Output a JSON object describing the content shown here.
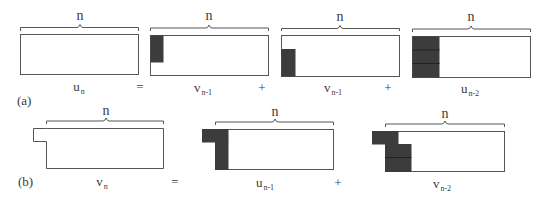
{
  "figure": {
    "row_a": {
      "tag": "(a)",
      "equation": {
        "lhs": {
          "base": "u",
          "sub": "n"
        },
        "eq": "=",
        "terms": [
          {
            "base": "v",
            "sub": "n-1"
          },
          {
            "op": "+"
          },
          {
            "base": "v",
            "sub": "n-1"
          },
          {
            "op": "+"
          },
          {
            "base": "u",
            "sub": "n-2"
          }
        ]
      },
      "brace_label": "n"
    },
    "row_b": {
      "tag": "(b)",
      "equation": {
        "lhs": {
          "base": "v",
          "sub": "n"
        },
        "eq": "=",
        "terms": [
          {
            "base": "u",
            "sub": "n-1"
          },
          {
            "op": "+"
          },
          {
            "base": "v",
            "sub": "n-2"
          }
        ]
      },
      "brace_label": "n"
    },
    "labels": {
      "a_tag": "(a)",
      "b_tag": "(b)",
      "n": "n",
      "eq": "=",
      "plus": "+",
      "a_lhs_base": "u",
      "a_lhs_sub": "n",
      "a_t1_base": "v",
      "a_t1_sub": "n-1",
      "a_t2_base": "v",
      "a_t2_sub": "n-1",
      "a_t3_base": "u",
      "a_t3_sub": "n-2",
      "b_lhs_base": "v",
      "b_lhs_sub": "n",
      "b_t1_base": "u",
      "b_t1_sub": "n-1",
      "b_t2_base": "v",
      "b_t2_sub": "n-2"
    },
    "colors": {
      "outline": "#555555",
      "tile_fill": "#3c3c3c",
      "tile_divider": "#222222",
      "text": "#3a3a3a"
    }
  }
}
